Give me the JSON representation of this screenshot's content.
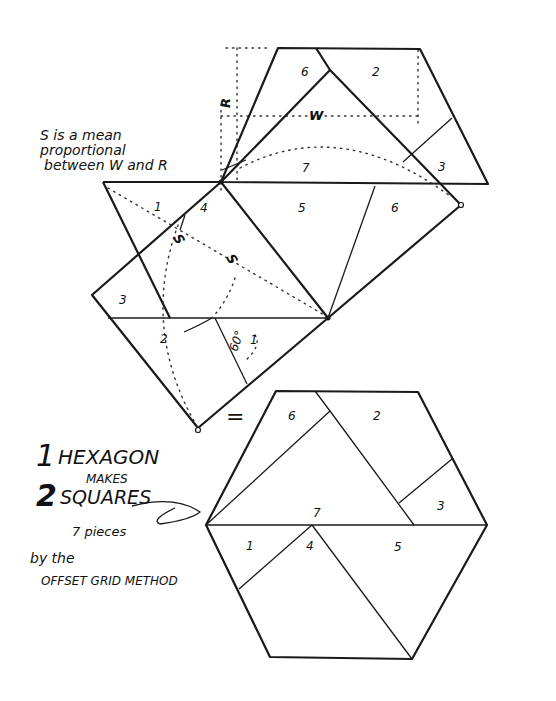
{
  "diagram": {
    "title_line1_number": "1",
    "title_line1_word": "HEXAGON",
    "title_makes": "MAKES",
    "title_line2_number": "2",
    "title_line2_word": "SQUARES",
    "pieces_note": "7 pieces",
    "method_by": "by the",
    "method_name": "OFFSET GRID METHOD",
    "annotation": {
      "line1": "S is a mean",
      "line2": "proportional",
      "line3": "between W and R"
    },
    "dimension_labels": {
      "R": "R",
      "W": "W",
      "S1": "S",
      "S2": "S"
    },
    "equals_sign": "=",
    "angle_label": "60°",
    "top_figure_piece_labels": {
      "p6_top": "6",
      "p2_top": "2",
      "p7": "7",
      "p3_top": "3",
      "p1_left": "1",
      "p4": "4",
      "p5": "5",
      "p6_right": "6",
      "p3_square": "3",
      "p2_square": "2",
      "p1_square": "1"
    },
    "hexagon_piece_labels": {
      "p6": "6",
      "p2": "2",
      "p7": "7",
      "p3": "3",
      "p1": "1",
      "p4": "4",
      "p5": "5"
    },
    "colors": {
      "ink": "#1a1a1a",
      "paper": "#ffffff"
    }
  }
}
